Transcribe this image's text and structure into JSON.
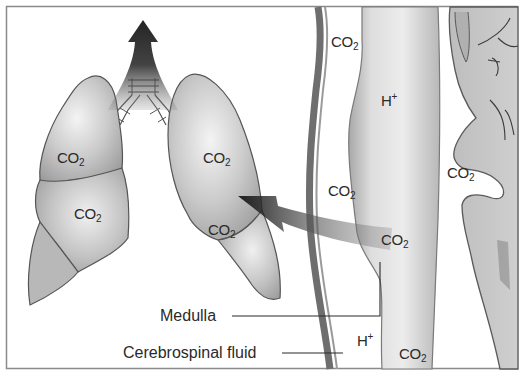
{
  "figure": {
    "colors": {
      "frame": "#8a8a8a",
      "organ_fill": "#c8c8c8",
      "organ_outline": "#555555",
      "arrow": "#111111",
      "text": "#2a2a2a",
      "background": "#ffffff"
    },
    "lungs": {
      "labels": [
        {
          "id": "left-upper-lobe",
          "base": "CO",
          "sub": "2"
        },
        {
          "id": "left-lower-lobe",
          "base": "CO",
          "sub": "2"
        },
        {
          "id": "right-upper-lobe",
          "base": "CO",
          "sub": "2"
        },
        {
          "id": "right-lower-lobe",
          "base": "CO",
          "sub": "2"
        }
      ]
    },
    "brainstem": {
      "labels": [
        {
          "id": "csf-top",
          "base": "CO",
          "sub": "2"
        },
        {
          "id": "medulla-top",
          "base": "H",
          "sup": "+"
        },
        {
          "id": "csf-middle",
          "base": "CO",
          "sub": "2"
        },
        {
          "id": "medulla-middle",
          "base": "CO",
          "sub": "2"
        },
        {
          "id": "cerebellum-gap",
          "base": "CO",
          "sub": "2"
        },
        {
          "id": "csf-bottom",
          "base": "H",
          "sup": "+"
        },
        {
          "id": "medulla-bottom",
          "base": "CO",
          "sub": "2"
        }
      ]
    },
    "callouts": {
      "medulla": "Medulla",
      "csf": "Cerebrospinal fluid"
    },
    "arrows": [
      {
        "id": "exhale-arrow",
        "direction": "up",
        "meaning": "CO2 exhaled via trachea"
      },
      {
        "id": "signal-arrow",
        "direction": "left",
        "meaning": "medulla signals lungs"
      }
    ]
  }
}
